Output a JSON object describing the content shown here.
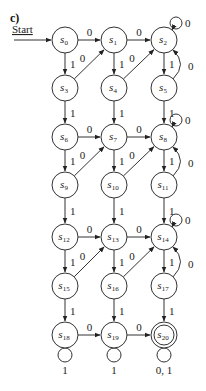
{
  "figure": {
    "label": "c)",
    "start_label": "Start",
    "start_node": "s0",
    "accepting": [
      "s20"
    ]
  },
  "nodes": [
    {
      "id": "s0",
      "base": "s",
      "sub": "0",
      "x": 65,
      "y": 40
    },
    {
      "id": "s1",
      "base": "s",
      "sub": "1",
      "x": 114,
      "y": 40
    },
    {
      "id": "s2",
      "base": "s",
      "sub": "2",
      "x": 164,
      "y": 40
    },
    {
      "id": "s3",
      "base": "s",
      "sub": "3",
      "x": 65,
      "y": 88
    },
    {
      "id": "s4",
      "base": "s",
      "sub": "4",
      "x": 114,
      "y": 88
    },
    {
      "id": "s5",
      "base": "s",
      "sub": "5",
      "x": 164,
      "y": 88
    },
    {
      "id": "s6",
      "base": "s",
      "sub": "6",
      "x": 65,
      "y": 137
    },
    {
      "id": "s7",
      "base": "s",
      "sub": "7",
      "x": 114,
      "y": 137
    },
    {
      "id": "s8",
      "base": "s",
      "sub": "8",
      "x": 164,
      "y": 137
    },
    {
      "id": "s9",
      "base": "s",
      "sub": "9",
      "x": 65,
      "y": 185
    },
    {
      "id": "s10",
      "base": "s",
      "sub": "10",
      "x": 114,
      "y": 185
    },
    {
      "id": "s11",
      "base": "s",
      "sub": "11",
      "x": 164,
      "y": 185
    },
    {
      "id": "s12",
      "base": "s",
      "sub": "12",
      "x": 65,
      "y": 237
    },
    {
      "id": "s13",
      "base": "s",
      "sub": "13",
      "x": 114,
      "y": 237
    },
    {
      "id": "s14",
      "base": "s",
      "sub": "14",
      "x": 164,
      "y": 237
    },
    {
      "id": "s15",
      "base": "s",
      "sub": "15",
      "x": 65,
      "y": 286
    },
    {
      "id": "s16",
      "base": "s",
      "sub": "16",
      "x": 114,
      "y": 286
    },
    {
      "id": "s17",
      "base": "s",
      "sub": "17",
      "x": 164,
      "y": 286
    },
    {
      "id": "s18",
      "base": "s",
      "sub": "18",
      "x": 65,
      "y": 335
    },
    {
      "id": "s19",
      "base": "s",
      "sub": "19",
      "x": 114,
      "y": 335
    },
    {
      "id": "s20",
      "base": "s",
      "sub": "20",
      "x": 164,
      "y": 335
    }
  ],
  "edges": [
    {
      "from": "s0",
      "to": "s1",
      "label": "0"
    },
    {
      "from": "s1",
      "to": "s2",
      "label": "0"
    },
    {
      "from": "s0",
      "to": "s3",
      "label": "1"
    },
    {
      "from": "s1",
      "to": "s4",
      "label": "1"
    },
    {
      "from": "s2",
      "to": "s5",
      "label": "1"
    },
    {
      "from": "s3",
      "to": "s1",
      "label": "0"
    },
    {
      "from": "s4",
      "to": "s2",
      "label": "0"
    },
    {
      "from": "s5",
      "to": "s2",
      "label": "0",
      "curve": true
    },
    {
      "from": "s2",
      "to": "s2",
      "label": "0",
      "loop": "top"
    },
    {
      "from": "s3",
      "to": "s6",
      "label": "1"
    },
    {
      "from": "s4",
      "to": "s7",
      "label": "1"
    },
    {
      "from": "s5",
      "to": "s8",
      "label": "1"
    },
    {
      "from": "s6",
      "to": "s7",
      "label": "0"
    },
    {
      "from": "s7",
      "to": "s8",
      "label": "0"
    },
    {
      "from": "s6",
      "to": "s9",
      "label": "1"
    },
    {
      "from": "s7",
      "to": "s10",
      "label": "1"
    },
    {
      "from": "s8",
      "to": "s11",
      "label": "1"
    },
    {
      "from": "s9",
      "to": "s7",
      "label": "0"
    },
    {
      "from": "s10",
      "to": "s8",
      "label": "0"
    },
    {
      "from": "s11",
      "to": "s8",
      "label": "0",
      "curve": true
    },
    {
      "from": "s8",
      "to": "s8",
      "label": "0",
      "loop": "top"
    },
    {
      "from": "s9",
      "to": "s12",
      "label": "1"
    },
    {
      "from": "s10",
      "to": "s13",
      "label": "1"
    },
    {
      "from": "s11",
      "to": "s14",
      "label": "1"
    },
    {
      "from": "s12",
      "to": "s13",
      "label": "0"
    },
    {
      "from": "s13",
      "to": "s14",
      "label": "0"
    },
    {
      "from": "s12",
      "to": "s15",
      "label": "1"
    },
    {
      "from": "s13",
      "to": "s16",
      "label": "1"
    },
    {
      "from": "s14",
      "to": "s17",
      "label": "1"
    },
    {
      "from": "s15",
      "to": "s13",
      "label": "0"
    },
    {
      "from": "s16",
      "to": "s14",
      "label": "0"
    },
    {
      "from": "s17",
      "to": "s14",
      "label": "0",
      "curve": true
    },
    {
      "from": "s14",
      "to": "s14",
      "label": "0",
      "loop": "top"
    },
    {
      "from": "s15",
      "to": "s18",
      "label": "1"
    },
    {
      "from": "s16",
      "to": "s19",
      "label": "1"
    },
    {
      "from": "s17",
      "to": "s20",
      "label": "1"
    },
    {
      "from": "s18",
      "to": "s19",
      "label": "0"
    },
    {
      "from": "s19",
      "to": "s20",
      "label": "0"
    },
    {
      "from": "s18",
      "to": "s18",
      "label": "1",
      "loop": "bottom"
    },
    {
      "from": "s19",
      "to": "s19",
      "label": "1",
      "loop": "bottom"
    },
    {
      "from": "s20",
      "to": "s20",
      "label": "0, 1",
      "loop": "bottom"
    }
  ]
}
